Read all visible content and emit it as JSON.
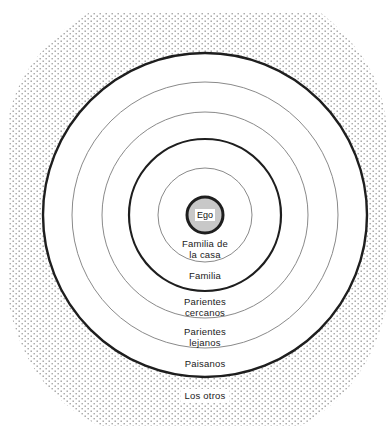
{
  "diagram": {
    "center": {
      "x": 205,
      "y": 215
    },
    "colors": {
      "ring_stroke": "#222222",
      "thin_stroke": "#8a8a8a",
      "stipple_dot": "#9a9a9a",
      "ego_fill": "#c8c8c8",
      "background": "#ffffff"
    },
    "rings": [
      {
        "name": "ego",
        "radius": 18,
        "weight": "thick"
      },
      {
        "name": "familia-de-la-casa",
        "radius": 47,
        "weight": "thin"
      },
      {
        "name": "familia",
        "radius": 76,
        "weight": "thick"
      },
      {
        "name": "parientes-cercanos",
        "radius": 103,
        "weight": "thin"
      },
      {
        "name": "parientes-lejanos",
        "radius": 133,
        "weight": "thin"
      },
      {
        "name": "paisanos",
        "radius": 162,
        "weight": "thick"
      }
    ],
    "labels": {
      "ego": "Ego",
      "familia_de_la_casa": "Familia de\nla casa",
      "familia": "Familia",
      "parientes_cercanos": "Parientes\ncercanos",
      "parientes_lejanos": "Parientes\nlejanos",
      "paisanos": "Paisanos",
      "los_otros": "Los otros"
    }
  }
}
